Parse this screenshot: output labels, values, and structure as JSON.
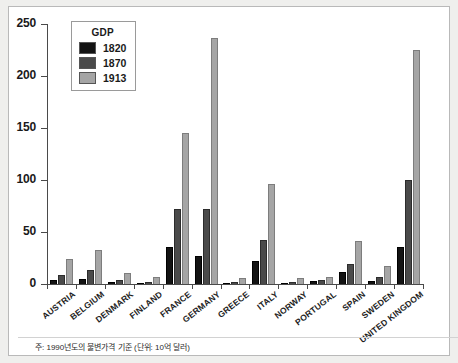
{
  "legend": {
    "title": "GDP",
    "entries": [
      {
        "label": "1820",
        "color": "#131313"
      },
      {
        "label": "1870",
        "color": "#4a4a4a"
      },
      {
        "label": "1913",
        "color": "#a5a5a5"
      }
    ]
  },
  "caption": "주: 1990년도의 불변가격 기준 (단위: 10억 달러)",
  "chart_data": {
    "type": "bar",
    "title": "",
    "xlabel": "",
    "ylabel": "",
    "ylim": [
      0,
      250
    ],
    "yticks": [
      0,
      50,
      100,
      150,
      200,
      250
    ],
    "ytick_labels": [
      "0",
      "50",
      "100",
      "150",
      "200",
      "250"
    ],
    "grid": false,
    "legend_position": "top-left",
    "categories": [
      "AUSTRIA",
      "BELGIUM",
      "DENMARK",
      "FINLAND",
      "FRANCE",
      "GERMANY",
      "GREECE",
      "ITALY",
      "NORWAY",
      "PORTUGAL",
      "SPAIN",
      "SWEDEN",
      "UNITED KINGDOM"
    ],
    "series": [
      {
        "name": "1820",
        "color": "#131313",
        "values": [
          4,
          5,
          1.5,
          1,
          36,
          27,
          1,
          22,
          1,
          3,
          12,
          3,
          36
        ]
      },
      {
        "name": "1870",
        "color": "#4a4a4a",
        "values": [
          9,
          13,
          3.5,
          2,
          72,
          72,
          2,
          42,
          2,
          4,
          19,
          6.5,
          100
        ]
      },
      {
        "name": "1913",
        "color": "#a5a5a5",
        "values": [
          24,
          33,
          11,
          7,
          145,
          237,
          6,
          96,
          6,
          7,
          41,
          17,
          225
        ]
      }
    ]
  }
}
